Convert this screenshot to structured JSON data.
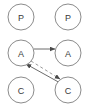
{
  "diagram": {
    "width": 88,
    "height": 107,
    "background_color": "#ffffff",
    "node_stroke_color": "#8c8c8c",
    "node_fill_color": "#ffffff",
    "label_color": "#3a3a3a",
    "edge_color": "#6b6b6b",
    "dashed_edge_color": "#9a9a9a",
    "columns": [
      "left",
      "right"
    ],
    "rows": [
      "top",
      "middle",
      "bottom"
    ],
    "nodes": [
      {
        "id": "p-left",
        "label": "P",
        "column": "left",
        "row": "top",
        "cx": 21,
        "cy": 17,
        "r": 13
      },
      {
        "id": "p-right",
        "label": "P",
        "column": "right",
        "row": "top",
        "cx": 68,
        "cy": 17,
        "r": 13
      },
      {
        "id": "a-left",
        "label": "A",
        "column": "left",
        "row": "middle",
        "cx": 21,
        "cy": 53,
        "r": 13
      },
      {
        "id": "a-right",
        "label": "A",
        "column": "right",
        "row": "middle",
        "cx": 68,
        "cy": 53,
        "r": 13
      },
      {
        "id": "c-left",
        "label": "C",
        "column": "left",
        "row": "bottom",
        "cx": 21,
        "cy": 90,
        "r": 13
      },
      {
        "id": "c-right",
        "label": "C",
        "column": "right",
        "row": "bottom",
        "cx": 68,
        "cy": 90,
        "r": 13
      }
    ],
    "edges": [
      {
        "id": "edge-a-left-to-a-right",
        "from": "a-left",
        "to": "a-right",
        "style": "solid",
        "arrow": "end",
        "x1": 34,
        "y1": 49,
        "x2": 55,
        "y2": 49
      },
      {
        "id": "edge-a-left-to-c-right",
        "from": "a-left",
        "to": "c-right",
        "style": "dashed",
        "arrow": "end",
        "x1": 31,
        "y1": 61,
        "x2": 60,
        "y2": 79
      },
      {
        "id": "edge-c-right-to-a-left",
        "from": "c-right",
        "to": "a-left",
        "style": "solid",
        "arrow": "end",
        "x1": 62,
        "y1": 84,
        "x2": 26,
        "y2": 64
      }
    ]
  }
}
